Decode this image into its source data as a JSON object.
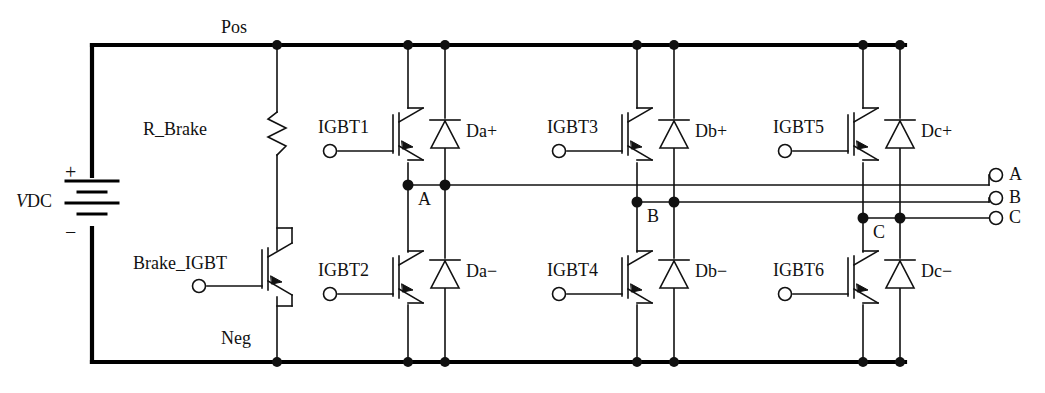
{
  "diagram": {
    "colors": {
      "line": "#111111",
      "rail": "#000000",
      "background": "#ffffff"
    },
    "source": {
      "name": "V_DC",
      "symbol_name": "battery",
      "label_main": "V",
      "label_sub": "DC",
      "plus": "+",
      "minus": "−"
    },
    "rails": [
      {
        "name": "pos-rail",
        "label": "Pos"
      },
      {
        "name": "neg-rail",
        "label": "Neg"
      }
    ],
    "brake": {
      "resistor_label": "R_Brake",
      "igbt_label": "Brake_IGBT"
    },
    "switches": [
      {
        "name": "igbt1",
        "label": "IGBT1"
      },
      {
        "name": "igbt2",
        "label": "IGBT2"
      },
      {
        "name": "igbt3",
        "label": "IGBT3"
      },
      {
        "name": "igbt4",
        "label": "IGBT4"
      },
      {
        "name": "igbt5",
        "label": "IGBT5"
      },
      {
        "name": "igbt6",
        "label": "IGBT6"
      }
    ],
    "diodes": [
      {
        "name": "da-plus",
        "label": "Da+"
      },
      {
        "name": "da-minus",
        "label": "Da−"
      },
      {
        "name": "db-plus",
        "label": "Db+"
      },
      {
        "name": "db-minus",
        "label": "Db−"
      },
      {
        "name": "dc-plus",
        "label": "Dc+"
      },
      {
        "name": "dc-minus",
        "label": "Dc−"
      }
    ],
    "phase_nodes": [
      {
        "name": "node-a",
        "label": "A"
      },
      {
        "name": "node-b",
        "label": "B"
      },
      {
        "name": "node-c",
        "label": "C"
      }
    ],
    "output_terminals": [
      {
        "name": "terminal-a",
        "label": "A"
      },
      {
        "name": "terminal-b",
        "label": "B"
      },
      {
        "name": "terminal-c",
        "label": "C"
      }
    ]
  }
}
